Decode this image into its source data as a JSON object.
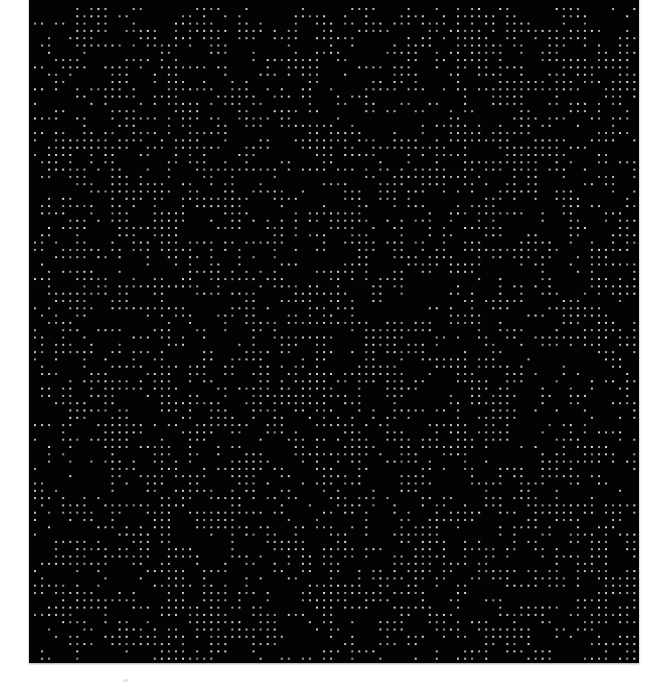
{
  "image": {
    "kind": "dot-matrix pattern",
    "background_color": "#ffffff",
    "panel": {
      "x": 29,
      "y": 0,
      "width": 610,
      "height": 663,
      "color": "#030303"
    },
    "dot_grid": {
      "origin_x": 5,
      "origin_y": 8,
      "pitch_x": 7.05,
      "pitch_y": 7.3,
      "columns": 86,
      "rows": 90,
      "dot_size": 2,
      "dot_color": "#b8b8b8",
      "fill_ratio": 0.42,
      "seed": 20240611
    },
    "artifacts": [
      {
        "x": 123,
        "y": 679,
        "description": "faint gray speck below panel"
      }
    ]
  }
}
